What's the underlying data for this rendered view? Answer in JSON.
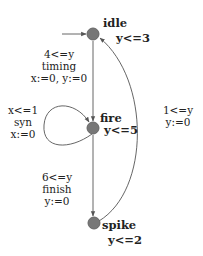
{
  "automaton": {
    "states": [
      {
        "id": "idle",
        "name": "idle",
        "invariant": "y<=3",
        "initial": true
      },
      {
        "id": "fire",
        "name": "fire",
        "invariant": "y<=5"
      },
      {
        "id": "spike",
        "name": "spike",
        "invariant": "y<=2"
      }
    ],
    "transitions": [
      {
        "from": "idle",
        "to": "fire",
        "guard": "4<=y",
        "sync": "timing",
        "update": "x:=0, y:=0"
      },
      {
        "from": "fire",
        "to": "fire",
        "guard": "x<=1",
        "sync": "syn",
        "update": "x:=0"
      },
      {
        "from": "fire",
        "to": "spike",
        "guard": "6<=y",
        "sync": "finish",
        "update": "y:=0"
      },
      {
        "from": "spike",
        "to": "idle",
        "guard": "1<=y",
        "update": "y:=0"
      }
    ]
  },
  "colors": {
    "node": "#777777",
    "edge": "#555555"
  }
}
